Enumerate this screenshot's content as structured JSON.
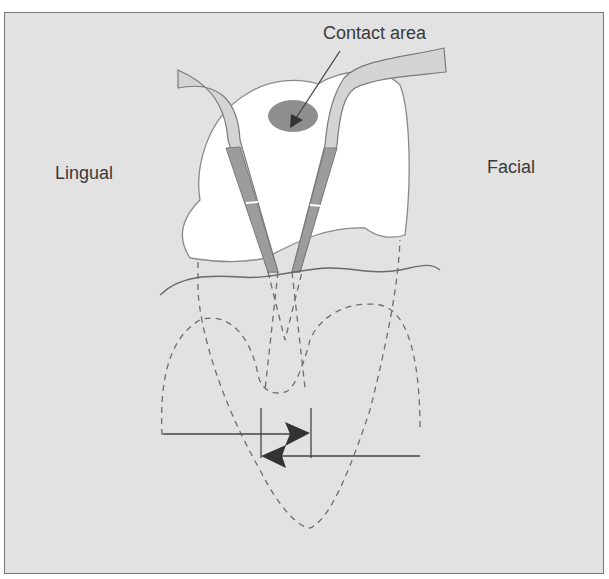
{
  "figure": {
    "labels": {
      "contact_area": "Contact area",
      "lingual": "Lingual",
      "facial": "Facial"
    },
    "colors": {
      "background": "#e2e2e2",
      "tooth_fill": "#ffffff",
      "outline": "#7a7a7a",
      "contact_fill": "#8e8e8e",
      "instrument_dark": "#9a9a9a",
      "instrument_light": "#d6d6d6",
      "arrow": "#333333",
      "dashed": "#6e6e6e"
    }
  }
}
